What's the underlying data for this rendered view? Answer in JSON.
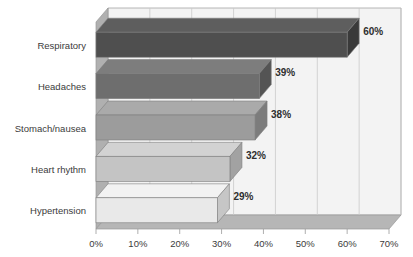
{
  "chart_data": {
    "type": "bar",
    "orientation": "horizontal",
    "style": "3d",
    "title": "",
    "subtitle": "",
    "xlabel": "",
    "ylabel": "",
    "categories": [
      "Respiratory",
      "Headaches",
      "Stomach/nausea",
      "Heart rhythm",
      "Hypertension"
    ],
    "values": [
      60,
      39,
      38,
      32,
      29
    ],
    "data_labels": [
      "60%",
      "39%",
      "38%",
      "32%",
      "29%"
    ],
    "xlim": [
      0,
      70
    ],
    "xticks": [
      0,
      10,
      20,
      30,
      40,
      50,
      60,
      70
    ],
    "xtick_labels": [
      "0%",
      "10%",
      "20%",
      "30%",
      "40%",
      "50%",
      "60%",
      "70%"
    ],
    "grid": true,
    "grid_axis": "x",
    "legend": false,
    "legend_position": "none",
    "bar_colors": [
      "#4f4f4f",
      "#6e6e6e",
      "#9c9c9c",
      "#c4c4c4",
      "#e9e9e9"
    ],
    "bar_side_colors": [
      "#3a3a3a",
      "#545454",
      "#7c7c7c",
      "#a2a2a2",
      "#c6c6c6"
    ],
    "bar_top_colors": [
      "#5e5e5e",
      "#7d7d7d",
      "#aaaaaa",
      "#d2d2d2",
      "#f2f2f2"
    ],
    "background_color": "#ffffff",
    "wall_color": "#f3f3f3",
    "floor_color": "#b6b6b6",
    "sidewall_color": "#b0b0b0",
    "gridline_color": "#c9c9c9",
    "axis_color": "#9a9a9a"
  },
  "axis": {
    "x_ticks": [
      {
        "value": 0,
        "label": "0%"
      },
      {
        "value": 10,
        "label": "10%"
      },
      {
        "value": 20,
        "label": "20%"
      },
      {
        "value": 30,
        "label": "30%"
      },
      {
        "value": 40,
        "label": "40%"
      },
      {
        "value": 50,
        "label": "50%"
      },
      {
        "value": 60,
        "label": "60%"
      },
      {
        "value": 70,
        "label": "70%"
      }
    ]
  },
  "series": [
    {
      "category": "Respiratory",
      "value": 60,
      "label": "60%"
    },
    {
      "category": "Headaches",
      "value": 39,
      "label": "39%"
    },
    {
      "category": "Stomach/nausea",
      "value": 38,
      "label": "38%"
    },
    {
      "category": "Heart rhythm",
      "value": 32,
      "label": "32%"
    },
    {
      "category": "Hypertension",
      "value": 29,
      "label": "29%"
    }
  ]
}
